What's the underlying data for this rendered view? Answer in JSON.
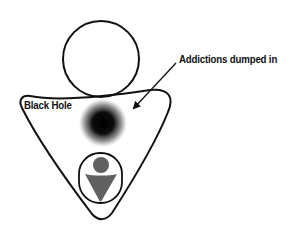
{
  "diagram": {
    "labels": {
      "addictions": "Addictions dumped in",
      "black_hole": "Black Hole"
    },
    "shapes": {
      "head_circle": {
        "shape": "circle-outline",
        "icon": "circle-icon"
      },
      "body_triangle": {
        "shape": "rounded-inverted-triangle-outline",
        "icon": "triangle-icon"
      },
      "black_hole": {
        "shape": "blurred-dark-circle",
        "icon": "black-hole-icon"
      },
      "arrow": {
        "shape": "arrow",
        "icon": "arrow-icon",
        "points_to": "black_hole"
      },
      "inner_person": {
        "shape": "person-in-rounded-frame",
        "icon": "person-icon"
      }
    },
    "colors": {
      "stroke": "#111111",
      "figure_gray": "#606060",
      "black_hole": "#000000",
      "background": "#ffffff"
    }
  }
}
